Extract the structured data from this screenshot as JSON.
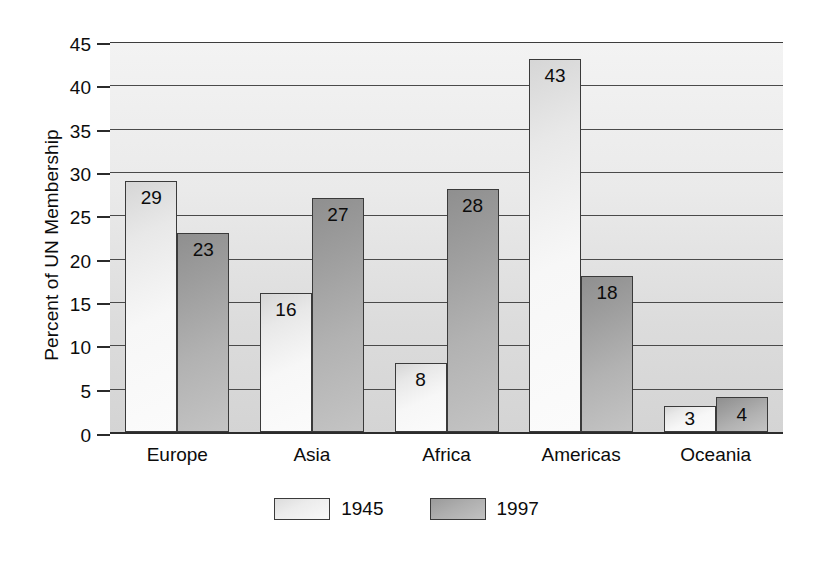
{
  "chart_data": {
    "type": "bar",
    "title": "",
    "subtitle": "",
    "xlabel": "",
    "ylabel": "Percent of UN Membership",
    "categories": [
      "Europe",
      "Asia",
      "Africa",
      "Americas",
      "Oceania"
    ],
    "series": [
      {
        "name": "1945",
        "values": [
          29,
          16,
          8,
          43,
          3
        ],
        "color": "#f3f3f3"
      },
      {
        "name": "1997",
        "values": [
          23,
          27,
          28,
          18,
          4
        ],
        "color": "#adadad"
      }
    ],
    "data_labels": {
      "1945": [
        "29",
        "16",
        "8",
        "43",
        "3"
      ],
      "1997": [
        "23",
        "27",
        "28",
        "18",
        "4"
      ]
    },
    "ylim": [
      0,
      45
    ],
    "ytick_values": [
      0,
      5,
      10,
      15,
      20,
      25,
      30,
      35,
      40,
      45
    ],
    "ytick_labels": [
      "0",
      "5",
      "10",
      "15",
      "20",
      "25",
      "30",
      "35",
      "40",
      "45"
    ],
    "grid": "horizontal",
    "legend_position": "bottom-center",
    "legend_entries": [
      "1945",
      "1997"
    ],
    "plot_background": "#e6e6e6",
    "bar_edge_color": "#3a3a3a"
  },
  "axis": {
    "y_title": "Percent of UN Membership"
  },
  "legend": {
    "items": [
      {
        "label": "1945"
      },
      {
        "label": "1997"
      }
    ]
  }
}
